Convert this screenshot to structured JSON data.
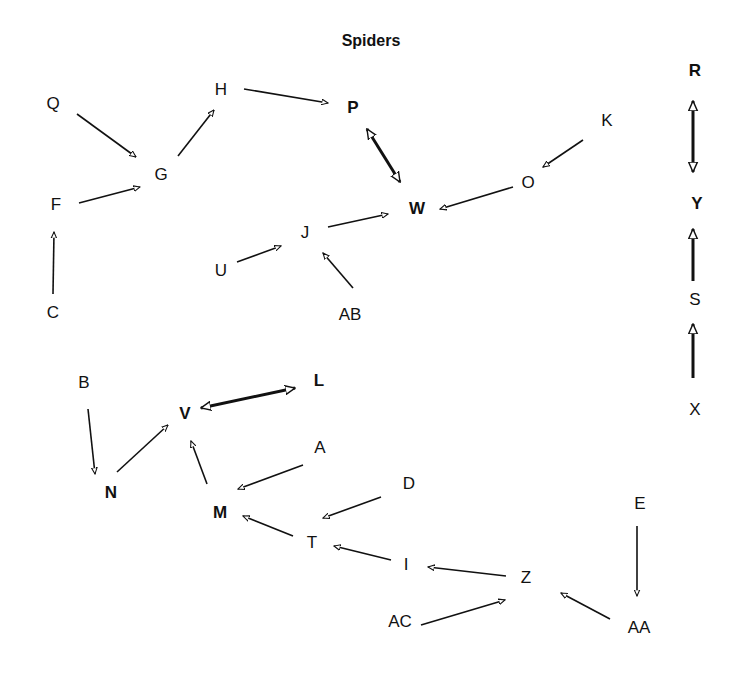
{
  "title": "Spiders",
  "nodes": [
    {
      "id": "Q",
      "x": 53,
      "y": 103,
      "bold": false
    },
    {
      "id": "H",
      "x": 221,
      "y": 89,
      "bold": false
    },
    {
      "id": "P",
      "x": 353,
      "y": 107,
      "bold": true
    },
    {
      "id": "K",
      "x": 607,
      "y": 120,
      "bold": false
    },
    {
      "id": "R",
      "x": 695,
      "y": 70,
      "bold": true
    },
    {
      "id": "G",
      "x": 161,
      "y": 174,
      "bold": false
    },
    {
      "id": "O",
      "x": 528,
      "y": 182,
      "bold": false
    },
    {
      "id": "F",
      "x": 56,
      "y": 204,
      "bold": false
    },
    {
      "id": "W",
      "x": 417,
      "y": 208,
      "bold": true
    },
    {
      "id": "Y",
      "x": 697,
      "y": 203,
      "bold": true
    },
    {
      "id": "J",
      "x": 305,
      "y": 232,
      "bold": false
    },
    {
      "id": "U",
      "x": 221,
      "y": 270,
      "bold": false
    },
    {
      "id": "C",
      "x": 53,
      "y": 312,
      "bold": false
    },
    {
      "id": "AB",
      "x": 350,
      "y": 314,
      "bold": false
    },
    {
      "id": "S",
      "x": 695,
      "y": 299,
      "bold": false
    },
    {
      "id": "B",
      "x": 84,
      "y": 382,
      "bold": false
    },
    {
      "id": "L",
      "x": 319,
      "y": 380,
      "bold": true
    },
    {
      "id": "V",
      "x": 185,
      "y": 413,
      "bold": true
    },
    {
      "id": "X",
      "x": 695,
      "y": 409,
      "bold": false
    },
    {
      "id": "A",
      "x": 320,
      "y": 447,
      "bold": false
    },
    {
      "id": "N",
      "x": 111,
      "y": 492,
      "bold": true
    },
    {
      "id": "D",
      "x": 409,
      "y": 483,
      "bold": false
    },
    {
      "id": "E",
      "x": 640,
      "y": 503,
      "bold": false
    },
    {
      "id": "M",
      "x": 220,
      "y": 512,
      "bold": true
    },
    {
      "id": "T",
      "x": 312,
      "y": 542,
      "bold": false
    },
    {
      "id": "I",
      "x": 406,
      "y": 564,
      "bold": false
    },
    {
      "id": "Z",
      "x": 526,
      "y": 577,
      "bold": false
    },
    {
      "id": "AC",
      "x": 400,
      "y": 621,
      "bold": false
    },
    {
      "id": "AA",
      "x": 639,
      "y": 627,
      "bold": false
    }
  ],
  "edges": [
    {
      "from": "Q",
      "to": "G",
      "x1": 77,
      "y1": 114,
      "x2": 136,
      "y2": 157,
      "type": "directed"
    },
    {
      "from": "F",
      "to": "G",
      "x1": 79,
      "y1": 203,
      "x2": 140,
      "y2": 187,
      "type": "directed"
    },
    {
      "from": "C",
      "to": "F",
      "x1": 53,
      "y1": 294,
      "x2": 54,
      "y2": 232,
      "type": "directed"
    },
    {
      "from": "G",
      "to": "H",
      "x1": 178,
      "y1": 156,
      "x2": 214,
      "y2": 110,
      "type": "directed"
    },
    {
      "from": "H",
      "to": "P",
      "x1": 244,
      "y1": 89,
      "x2": 328,
      "y2": 103,
      "type": "directed"
    },
    {
      "from": "P",
      "to": "W",
      "x1": 367,
      "y1": 129,
      "x2": 400,
      "y2": 182,
      "type": "bidirectional",
      "heavy": true
    },
    {
      "from": "K",
      "to": "O",
      "x1": 583,
      "y1": 140,
      "x2": 543,
      "y2": 167,
      "type": "directed"
    },
    {
      "from": "O",
      "to": "W",
      "x1": 513,
      "y1": 187,
      "x2": 440,
      "y2": 209,
      "type": "directed"
    },
    {
      "from": "J",
      "to": "W",
      "x1": 328,
      "y1": 227,
      "x2": 388,
      "y2": 214,
      "type": "directed"
    },
    {
      "from": "U",
      "to": "J",
      "x1": 237,
      "y1": 262,
      "x2": 281,
      "y2": 246,
      "type": "directed"
    },
    {
      "from": "AB",
      "to": "J",
      "x1": 353,
      "y1": 288,
      "x2": 323,
      "y2": 253,
      "type": "directed"
    },
    {
      "from": "R",
      "to": "Y",
      "x1": 693,
      "y1": 101,
      "x2": 693,
      "y2": 172,
      "type": "bidirectional",
      "heavy": true
    },
    {
      "from": "S",
      "to": "Y",
      "x1": 693,
      "y1": 281,
      "x2": 693,
      "y2": 229,
      "type": "directed",
      "heavy": true
    },
    {
      "from": "X",
      "to": "S",
      "x1": 693,
      "y1": 378,
      "x2": 693,
      "y2": 324,
      "type": "directed",
      "heavy": true
    },
    {
      "from": "V",
      "to": "L",
      "x1": 201,
      "y1": 408,
      "x2": 295,
      "y2": 388,
      "type": "bidirectional",
      "heavy": true
    },
    {
      "from": "B",
      "to": "N",
      "x1": 88,
      "y1": 409,
      "x2": 95,
      "y2": 474,
      "type": "directed"
    },
    {
      "from": "N",
      "to": "V",
      "x1": 117,
      "y1": 472,
      "x2": 168,
      "y2": 425,
      "type": "directed"
    },
    {
      "from": "M",
      "to": "V",
      "x1": 207,
      "y1": 484,
      "x2": 191,
      "y2": 441,
      "type": "directed"
    },
    {
      "from": "A",
      "to": "M",
      "x1": 303,
      "y1": 465,
      "x2": 238,
      "y2": 489,
      "type": "directed"
    },
    {
      "from": "D",
      "to": "T",
      "x1": 381,
      "y1": 497,
      "x2": 323,
      "y2": 518,
      "type": "directed"
    },
    {
      "from": "T",
      "to": "M",
      "x1": 293,
      "y1": 536,
      "x2": 243,
      "y2": 516,
      "type": "directed"
    },
    {
      "from": "I",
      "to": "T",
      "x1": 391,
      "y1": 560,
      "x2": 334,
      "y2": 546,
      "type": "directed"
    },
    {
      "from": "Z",
      "to": "I",
      "x1": 506,
      "y1": 576,
      "x2": 428,
      "y2": 567,
      "type": "directed"
    },
    {
      "from": "AC",
      "to": "Z",
      "x1": 421,
      "y1": 625,
      "x2": 505,
      "y2": 600,
      "type": "directed"
    },
    {
      "from": "AA",
      "to": "Z",
      "x1": 610,
      "y1": 619,
      "x2": 561,
      "y2": 593,
      "type": "directed"
    },
    {
      "from": "E",
      "to": "AA",
      "x1": 637,
      "y1": 526,
      "x2": 637,
      "y2": 596,
      "type": "directed"
    }
  ]
}
